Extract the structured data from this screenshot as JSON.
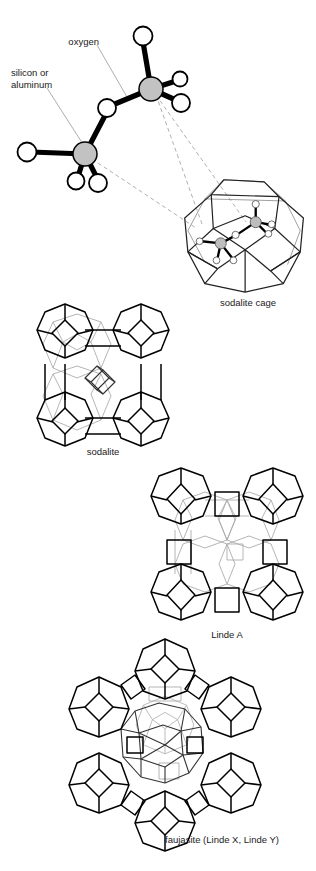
{
  "figure": {
    "background_color": "#ffffff",
    "width": 316,
    "height": 871
  },
  "legend": {
    "oxygen_label": "oxygen",
    "silicon_label_line1": "silicon or",
    "silicon_label_line2": "aluminum",
    "oxygen_color": "#ffffff",
    "silicon_color": "#c2c2c2",
    "bond_color": "#000000",
    "leader_color": "#8a8a8a"
  },
  "captions": {
    "sodalite_cage": "sodalite cage",
    "sodalite": "sodalite",
    "linde_a": "Linde A",
    "faujasite": "faujasite (Linde X, Linde Y)"
  },
  "panels": [
    {
      "id": "tetrahedra-detail",
      "name": "linked-tetrahedra-diagram",
      "caption": "",
      "description": "Two corner-sharing TO4 tetrahedra with bridging oxygen"
    },
    {
      "id": "sodalite-cage",
      "name": "sodalite-cage-diagram",
      "caption": "sodalite cage",
      "description": "Truncated octahedron beta cage with embedded tetrahedra"
    },
    {
      "id": "sodalite",
      "name": "sodalite-framework-diagram",
      "caption": "sodalite",
      "description": "Sodalite cages joined through shared square faces"
    },
    {
      "id": "linde-a",
      "name": "linde-a-framework-diagram",
      "caption": "Linde A",
      "description": "Sodalite cages joined through double four-rings"
    },
    {
      "id": "faujasite",
      "name": "faujasite-framework-diagram",
      "caption": "faujasite (Linde X, Linde Y)",
      "description": "Sodalite cages joined through double six-rings"
    }
  ]
}
